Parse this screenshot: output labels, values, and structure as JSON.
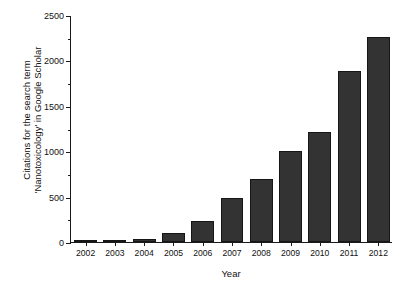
{
  "chart_data": {
    "type": "bar",
    "title": "",
    "subtitle": "",
    "xlabel": "Year",
    "ylabel": "Citations for the search term 'Nanotoxicology' in Google Scholar",
    "ylabel_lines": [
      "Citations for the search term",
      "'Nanotoxicology' in Google Scholar"
    ],
    "categories": [
      "2002",
      "2003",
      "2004",
      "2005",
      "2006",
      "2007",
      "2008",
      "2009",
      "2010",
      "2011",
      "2012"
    ],
    "values": [
      2,
      10,
      35,
      100,
      230,
      480,
      690,
      1000,
      1215,
      1880,
      2260
    ],
    "series": [
      {
        "name": "Citations",
        "values": [
          2,
          10,
          35,
          100,
          230,
          480,
          690,
          1000,
          1215,
          1880,
          2260
        ]
      }
    ],
    "ylim": [
      0,
      2500
    ],
    "y_major_ticks": [
      0,
      500,
      1000,
      1500,
      2000,
      2500
    ],
    "y_major_tick_labels": [
      "0",
      "500",
      "1000",
      "1500",
      "2000",
      "2500"
    ],
    "y_minor_ticks": [
      250,
      750,
      1250,
      1750,
      2250
    ],
    "grid": false,
    "legend": false,
    "legend_position": "none",
    "bar_color": "#333333",
    "bar_edge_color": "#161616",
    "axis_color": "#1a1a1a",
    "background_color": "#ffffff",
    "bar_width_fraction": 0.78
  }
}
